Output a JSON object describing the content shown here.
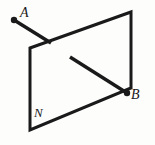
{
  "figure": {
    "background_color": "#fdfdfc",
    "stroke_color": "#1a1a1a",
    "labels": {
      "point_a": "A",
      "point_b": "B",
      "plane": "N"
    },
    "geometry": {
      "plane": {
        "name": "N",
        "shape": "parallelogram",
        "corners": {
          "top_left": [
            30,
            48
          ],
          "top_right": [
            131,
            12
          ],
          "bottom_right": [
            131,
            88
          ],
          "bottom_left": [
            30,
            130
          ]
        },
        "stroke_width": 3
      },
      "ray_a": {
        "from_point": "A",
        "start": [
          14,
          20
        ],
        "end": [
          51,
          43
        ],
        "endpoint_dot": [
          14,
          20
        ],
        "dot_radius": 3.2,
        "stroke_width": 3.4
      },
      "segment_b": {
        "to_point": "B",
        "start": [
          70,
          57
        ],
        "end": [
          127,
          93
        ],
        "endpoint_dot": [
          127,
          93
        ],
        "dot_radius": 3.2,
        "stroke_width": 3.4,
        "note": "crosses the right edge of plane N"
      }
    }
  }
}
